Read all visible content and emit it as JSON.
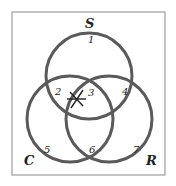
{
  "diagram": {
    "type": "venn",
    "sets": [
      {
        "name": "S",
        "label": "S"
      },
      {
        "name": "C",
        "label": "C"
      },
      {
        "name": "R",
        "label": "R"
      }
    ],
    "regions": [
      {
        "id": "1",
        "label": "1",
        "in": [
          "S"
        ]
      },
      {
        "id": "2",
        "label": "2",
        "in": [
          "S",
          "C"
        ]
      },
      {
        "id": "3",
        "label": "3",
        "in": [
          "S",
          "C",
          "R"
        ]
      },
      {
        "id": "4",
        "label": "4",
        "in": [
          "S",
          "R"
        ]
      },
      {
        "id": "5",
        "label": "5",
        "in": [
          "C"
        ]
      },
      {
        "id": "6",
        "label": "6",
        "in": [
          "C",
          "R"
        ]
      },
      {
        "id": "7",
        "label": "7",
        "in": [
          "R"
        ]
      }
    ],
    "marker": {
      "symbol": "asterisk",
      "region": "2/3 boundary"
    },
    "colors": {
      "outline": "#555555",
      "circle": "#5a5a5a",
      "box": "#8a8a8a"
    }
  }
}
